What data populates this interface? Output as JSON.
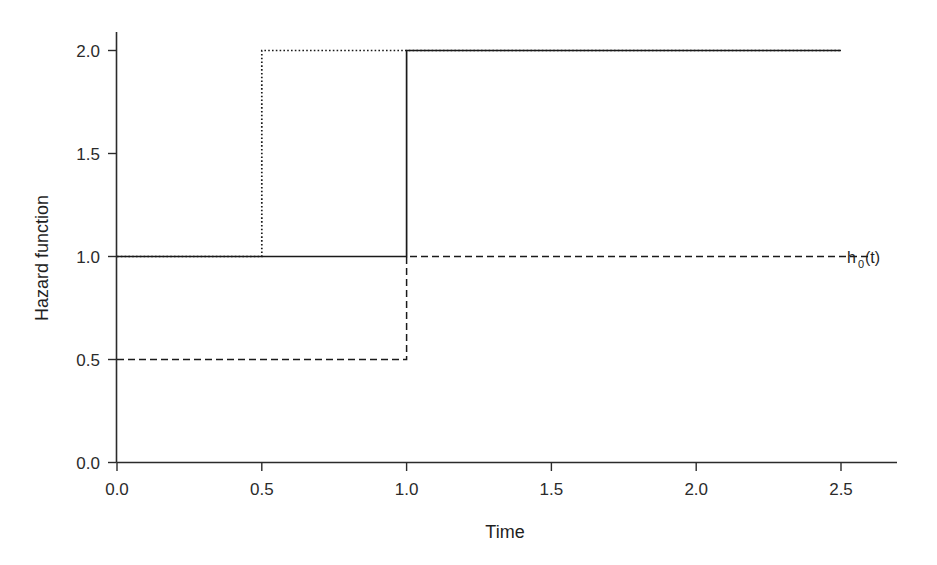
{
  "chart_data": {
    "type": "line",
    "title": "",
    "xlabel": "Time",
    "ylabel": "Hazard function",
    "xlim": [
      0.0,
      2.7
    ],
    "ylim": [
      0.0,
      2.1
    ],
    "xticks": [
      "0.0",
      "0.5",
      "1.0",
      "1.5",
      "2.0",
      "2.5"
    ],
    "xtick_values": [
      0.0,
      0.5,
      1.0,
      1.5,
      2.0,
      2.5
    ],
    "yticks": [
      "0.0",
      "0.5",
      "1.0",
      "1.5",
      "2.0"
    ],
    "ytick_values": [
      0.0,
      0.5,
      1.0,
      1.5,
      2.0
    ],
    "grid": false,
    "legend_position": "right-inline",
    "series": [
      {
        "name": "solid-step",
        "style": "solid",
        "label": "",
        "step": true,
        "x": [
          0.0,
          1.0,
          1.0,
          2.5
        ],
        "y": [
          1.0,
          1.0,
          2.0,
          2.0
        ]
      },
      {
        "name": "dotted-step",
        "style": "dotted",
        "label": "",
        "step": true,
        "x": [
          0.0,
          0.5,
          0.5,
          2.5
        ],
        "y": [
          1.0,
          1.0,
          2.0,
          2.0
        ]
      },
      {
        "name": "dashed-step",
        "style": "dashed",
        "label": "h0(t)",
        "step": true,
        "x": [
          0.0,
          1.0,
          1.0,
          2.6
        ],
        "y": [
          0.5,
          0.5,
          1.0,
          1.0
        ]
      }
    ],
    "annotations": [
      {
        "name": "baseline-hazard-label",
        "text_base": "h",
        "text_sub": "0",
        "text_tail": "(t)",
        "x": 2.62,
        "y": 1.0
      }
    ]
  },
  "axis": {
    "x_title": "Time",
    "y_title": "Hazard function"
  },
  "ticks": {
    "x": [
      "0.0",
      "0.5",
      "1.0",
      "1.5",
      "2.0",
      "2.5"
    ],
    "y": [
      "0.0",
      "0.5",
      "1.0",
      "1.5",
      "2.0"
    ]
  },
  "legend": {
    "h0_base": "h",
    "h0_sub": "0",
    "h0_tail": "(t)"
  },
  "colors": {
    "line": "#1a1a1a",
    "axis": "#2b2b2b",
    "text": "#1f1f1f",
    "background": "#ffffff"
  }
}
